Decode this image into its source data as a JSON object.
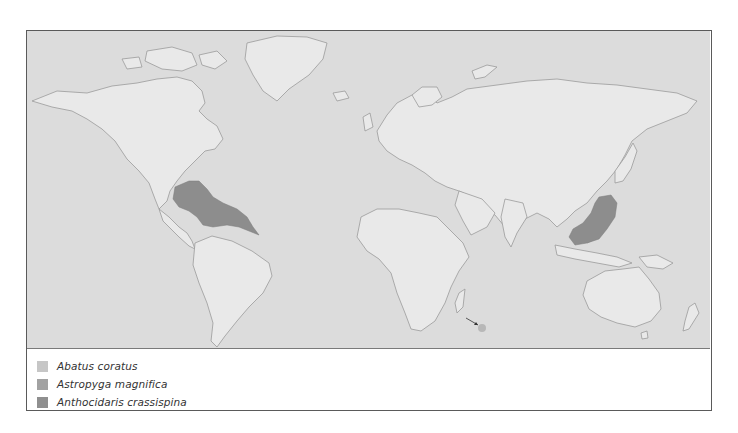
{
  "map": {
    "title": "",
    "ocean_color": "#dadada",
    "land_color": "#e9e9e9",
    "coast_color": "#9a9a9a",
    "ranges": [
      {
        "species": "Astropyga magnifica",
        "region": "Gulf of Mexico and Caribbean Sea",
        "color": "#8d8d8d"
      },
      {
        "species": "Anthocidaris crassispina",
        "region": "Southern China, Taiwan, Korea, southern Japan",
        "color": "#8d8d8d"
      },
      {
        "species": "Abatus coratus",
        "region": "Southern Indian Ocean sub-Antarctic island (arrow marker)",
        "color": "#bdbdbd"
      }
    ],
    "arrow_marker": {
      "label": "arrow",
      "target": "Abatus coratus location"
    }
  },
  "legend": {
    "items": [
      {
        "label": "Abatus coratus",
        "color": "#c6c6c6"
      },
      {
        "label": "Astropyga magnifica",
        "color": "#a2a2a2"
      },
      {
        "label": "Anthocidaris crassispina",
        "color": "#8f8f8f"
      }
    ]
  }
}
